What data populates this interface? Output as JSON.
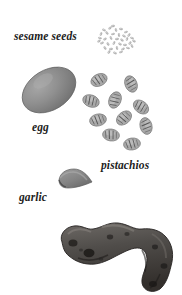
{
  "figure": {
    "background_color": "#ffffff",
    "width": 182,
    "height": 295,
    "labels": [
      {
        "id": "sesame",
        "text": "sesame seeds"
      },
      {
        "id": "egg",
        "text": "egg"
      },
      {
        "id": "pistachios",
        "text": "pistachios"
      },
      {
        "id": "garlic",
        "text": "garlic"
      }
    ],
    "specimens": [
      {
        "name": "sesame-seeds",
        "label": "sesame seeds",
        "shape": "speckled-cluster",
        "count_visible": "many",
        "color": "#b9b9b9"
      },
      {
        "name": "egg",
        "label": "egg",
        "shape": "ellipse",
        "color": "#8e8e8e"
      },
      {
        "name": "pistachios",
        "label": "pistachios",
        "shape": "scattered-kernels",
        "count_visible": 10,
        "color": "#a8a8a8"
      },
      {
        "name": "garlic",
        "label": "garlic",
        "shape": "clove-wedge",
        "color": "#8a8a8a"
      },
      {
        "name": "ginger-root",
        "label": "",
        "shape": "knobby-rhizome",
        "color": "#4a4846"
      }
    ]
  }
}
